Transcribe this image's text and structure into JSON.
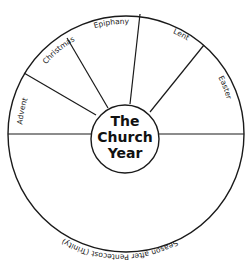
{
  "diagram": {
    "title_lines": [
      "The",
      "Church",
      "Year"
    ],
    "segments": [
      {
        "label": "Advent"
      },
      {
        "label": "Christmas"
      },
      {
        "label": "Epiphany"
      },
      {
        "label": "Lent"
      },
      {
        "label": "Easter"
      },
      {
        "label": "Season after Pentecost (Trinity)"
      }
    ],
    "colors": {
      "stroke": "#1a1a1a",
      "background": "#ffffff"
    }
  }
}
